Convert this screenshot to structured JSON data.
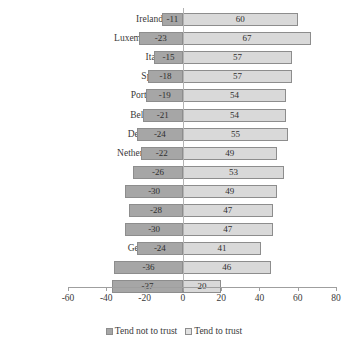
{
  "chart_data": {
    "type": "bar",
    "orientation": "horizontal",
    "stacked": "diverging",
    "title": "",
    "subtitle": "",
    "xlabel": "",
    "ylabel": "",
    "xlim": [
      -60,
      80
    ],
    "xticks": [
      -60,
      -40,
      -20,
      0,
      20,
      40,
      60,
      80
    ],
    "xtick_labels": [
      "-60",
      "-40",
      "-20",
      "0",
      "20",
      "40",
      "60",
      "80"
    ],
    "grid": false,
    "zero_line": true,
    "legend_position": "bottom",
    "categories": [
      "Ireland",
      "Luxembourg",
      "Italy",
      "Spain",
      "Portugal",
      "Belgium",
      "Denmark",
      "Netherlands",
      "Greece",
      "Finland",
      "Austria",
      "France",
      "Germany",
      "Sweden",
      "UK"
    ],
    "series": [
      {
        "name": "Tend not to trust",
        "color": "#a6a6a6",
        "values": [
          -11,
          -23,
          -15,
          -18,
          -19,
          -21,
          -24,
          -22,
          -26,
          -30,
          -28,
          -30,
          -24,
          -36,
          -37
        ]
      },
      {
        "name": "Tend to trust",
        "color": "#d9d9d9",
        "values": [
          60,
          67,
          57,
          57,
          54,
          54,
          55,
          49,
          53,
          49,
          47,
          47,
          41,
          46,
          20
        ]
      }
    ],
    "data_labels": {
      "negative": [
        "-11",
        "-23",
        "-15",
        "-18",
        "-19",
        "-21",
        "-24",
        "-22",
        "-26",
        "-30",
        "-28",
        "-30",
        "-24",
        "-36",
        "-37"
      ],
      "positive": [
        "60",
        "67",
        "57",
        "57",
        "54",
        "54",
        "55",
        "49",
        "53",
        "49",
        "47",
        "47",
        "41",
        "46",
        "20"
      ]
    }
  },
  "legend": {
    "entries": [
      {
        "label": "Tend not to trust",
        "swatch": "dark-gray"
      },
      {
        "label": "Tend to trust",
        "swatch": "light-gray"
      }
    ]
  }
}
